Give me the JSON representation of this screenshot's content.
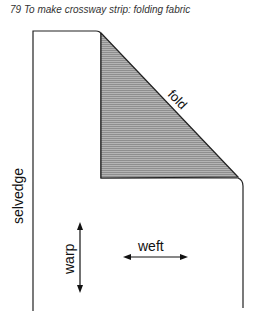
{
  "caption": "79 To make crossway strip: folding fabric",
  "labels": {
    "fold": "fold",
    "selvedge": "selvedge",
    "warp": "warp",
    "weft": "weft"
  },
  "colors": {
    "line": "#222222",
    "shaded": "#a8a8a8"
  }
}
